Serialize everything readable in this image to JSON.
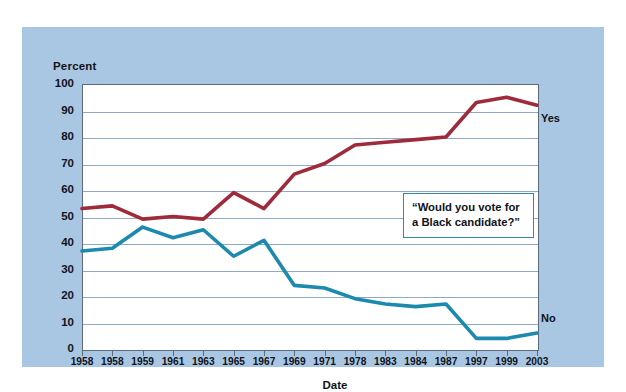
{
  "chart_data": {
    "type": "line",
    "title": "",
    "xlabel": "Date",
    "ylabel": "Percent",
    "ylim": [
      0,
      100
    ],
    "ytick_step": 10,
    "yticks": [
      100,
      90,
      80,
      70,
      60,
      50,
      40,
      30,
      20,
      10,
      0
    ],
    "grid": true,
    "legend_position": "inline-right",
    "categories": [
      "1958",
      "1958",
      "1959",
      "1961",
      "1963",
      "1965",
      "1967",
      "1969",
      "1971",
      "1978",
      "1983",
      "1984",
      "1987",
      "1997",
      "1999",
      "2003"
    ],
    "series": [
      {
        "name": "Yes",
        "color": "#9e2a3a",
        "values": [
          53,
          54,
          49,
          50,
          49,
          59,
          53,
          66,
          70,
          77,
          78,
          79,
          80,
          93,
          95,
          92
        ]
      },
      {
        "name": "No",
        "color": "#1b8aad",
        "values": [
          37,
          38,
          46,
          42,
          45,
          35,
          41,
          24,
          23,
          19,
          17,
          16,
          17,
          4,
          4,
          6
        ]
      }
    ],
    "annotations": [
      {
        "name": "question-callout",
        "text": "“Would you vote for a Black candidate?”",
        "line1": "“Would you vote for",
        "line2": "a Black candidate?”"
      }
    ]
  },
  "labels": {
    "y_axis_title": "Percent",
    "x_axis_title": "Date",
    "series_yes": "Yes",
    "series_no": "No"
  },
  "colors": {
    "panel_background": "#a9c6e3",
    "plot_background": "#ffffff",
    "gridline": "#8fa8c4",
    "axis": "#5b6b7d",
    "yes_line": "#9e2a3a",
    "no_line": "#1b8aad",
    "callout_border": "#2f89a8",
    "text": "#11131a"
  }
}
